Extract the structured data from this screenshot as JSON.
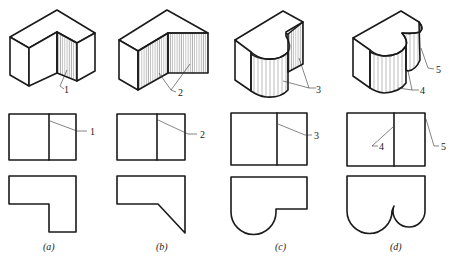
{
  "figure": {
    "panels": [
      {
        "id": "a",
        "caption": "(a)",
        "callouts": [
          "1"
        ]
      },
      {
        "id": "b",
        "caption": "(b)",
        "callouts": [
          "2"
        ]
      },
      {
        "id": "c",
        "caption": "(c)",
        "callouts": [
          "3"
        ]
      },
      {
        "id": "d",
        "caption": "(d)",
        "callouts": [
          "4",
          "5"
        ]
      }
    ],
    "colors": {
      "line": "#1a1a1a",
      "hatch": "#555555",
      "background": "#ffffff"
    }
  }
}
